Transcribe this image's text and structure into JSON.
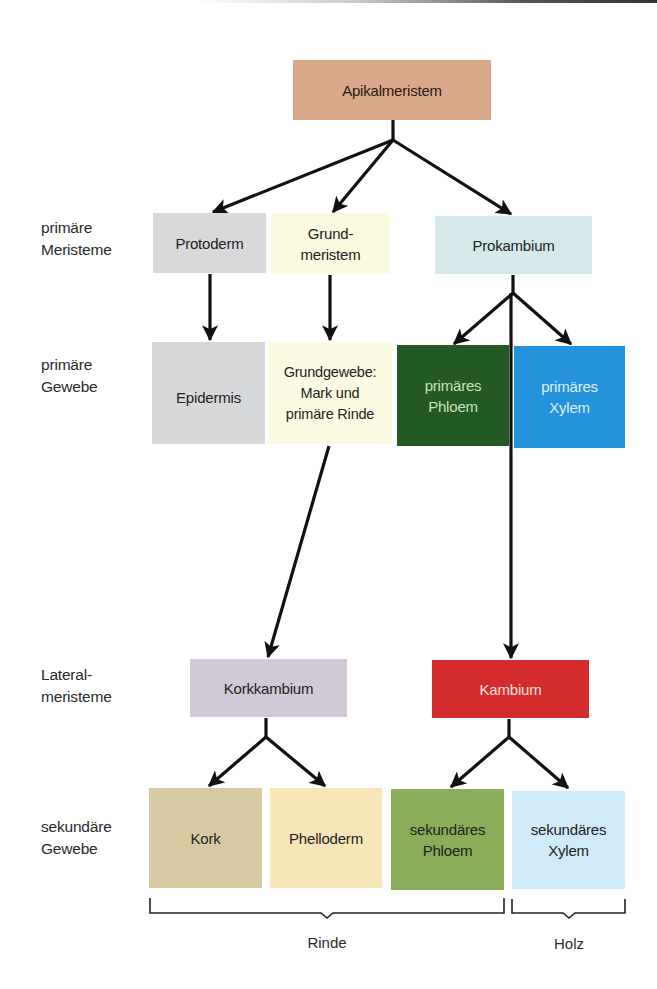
{
  "diagram": {
    "row_labels": [
      {
        "line1": "primäre",
        "line2": "Meristeme"
      },
      {
        "line1": "primäre",
        "line2": "Gewebe"
      },
      {
        "line1": "Lateral-",
        "line2": "meristeme"
      },
      {
        "line1": "sekundäre",
        "line2": "Gewebe"
      }
    ],
    "nodes": {
      "apikalmeristem": {
        "line1": "Apikalmeristem",
        "color": "#d9a98a"
      },
      "protoderm": {
        "line1": "Protoderm",
        "color": "#d8d9da"
      },
      "grundmeristem": {
        "line1": "Grund-",
        "line2": "meristem",
        "color": "#fbfbe0"
      },
      "prokambium": {
        "line1": "Prokambium",
        "color": "#d5e9ea"
      },
      "epidermis": {
        "line1": "Epidermis",
        "color": "#d7d8d9"
      },
      "grundgewebe": {
        "line1": "Grundgewebe:",
        "line2": "Mark und",
        "line3": "primäre Rinde",
        "color": "#fbfbe2"
      },
      "primaeres_phloem": {
        "line1": "primäres",
        "line2": "Phloem",
        "color": "#235a24",
        "text_color": "#c9e2b2"
      },
      "primaeres_xylem": {
        "line1": "primäres",
        "line2": "Xylem",
        "color": "#2592dc",
        "text_color": "#dff0fb"
      },
      "korkkambium": {
        "line1": "Korkkambium",
        "color": "#d2c9d6"
      },
      "kambium": {
        "line1": "Kambium",
        "color": "#d42b2c",
        "text_color": "#fbe3dc"
      },
      "kork": {
        "line1": "Kork",
        "color": "#d9c9a3"
      },
      "phelloderm": {
        "line1": "Phelloderm",
        "color": "#f9e6b8"
      },
      "sekundaeres_phloem": {
        "line1": "sekundäres",
        "line2": "Phloem",
        "color": "#8aad5a"
      },
      "sekundaeres_xylem": {
        "line1": "sekundäres",
        "line2": "Xylem",
        "color": "#cfeaf8"
      }
    },
    "groups": [
      {
        "label": "Rinde",
        "spans": [
          "kork",
          "phelloderm",
          "sekundaeres_phloem"
        ]
      },
      {
        "label": "Holz",
        "spans": [
          "sekundaeres_xylem"
        ]
      }
    ],
    "edges": [
      [
        "apikalmeristem",
        "protoderm"
      ],
      [
        "apikalmeristem",
        "grundmeristem"
      ],
      [
        "apikalmeristem",
        "prokambium"
      ],
      [
        "protoderm",
        "epidermis"
      ],
      [
        "grundmeristem",
        "grundgewebe"
      ],
      [
        "prokambium",
        "primaeres_phloem"
      ],
      [
        "prokambium",
        "primaeres_xylem"
      ],
      [
        "prokambium",
        "kambium"
      ],
      [
        "grundgewebe",
        "korkkambium"
      ],
      [
        "korkkambium",
        "kork"
      ],
      [
        "korkkambium",
        "phelloderm"
      ],
      [
        "kambium",
        "sekundaeres_phloem"
      ],
      [
        "kambium",
        "sekundaeres_xylem"
      ]
    ],
    "line_color": "#111111"
  }
}
